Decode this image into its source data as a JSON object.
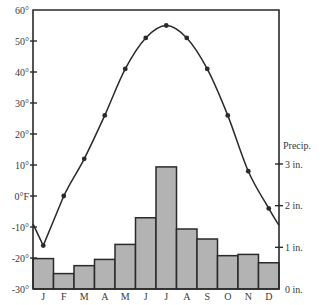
{
  "chart_data": {
    "type": "bar+line",
    "title": "",
    "categories": [
      "J",
      "F",
      "M",
      "A",
      "M",
      "J",
      "J",
      "A",
      "S",
      "O",
      "N",
      "D"
    ],
    "series": [
      {
        "name": "Temperature",
        "type": "line",
        "unit": "°F",
        "axis": "left",
        "values": [
          -16,
          0,
          12,
          26,
          41,
          51,
          55,
          51,
          41,
          26,
          8,
          -4
        ]
      },
      {
        "name": "Precipitation",
        "type": "bar",
        "unit": "in.",
        "axis": "right",
        "values": [
          0.73,
          0.37,
          0.56,
          0.71,
          1.07,
          1.71,
          2.93,
          1.44,
          1.2,
          0.8,
          0.83,
          0.63
        ]
      }
    ],
    "left_axis": {
      "label": "",
      "ylim": [
        -30,
        60
      ],
      "ticks": [
        60,
        50,
        40,
        30,
        20,
        10,
        0,
        -10,
        -20,
        -30
      ],
      "tick_labels": [
        "60°",
        "50°",
        "40°",
        "30°",
        "20°",
        "10°",
        "0°F",
        "-10°",
        "-20°",
        "-30°"
      ]
    },
    "right_axis": {
      "label": "Precip.",
      "ylim": [
        0,
        3
      ],
      "ticks": [
        3,
        2,
        1,
        0
      ],
      "tick_labels": [
        "3 in.",
        "2 in.",
        "1 in.",
        "0 in."
      ]
    },
    "xlabel": "",
    "grid": false,
    "legend": null
  },
  "colors": {
    "bar_fill": "#b3b3b3",
    "bar_stroke": "#2a2a2a",
    "line": "#2a2a2a",
    "axis": "#2a2a2a",
    "text": "#3a3a3a"
  }
}
